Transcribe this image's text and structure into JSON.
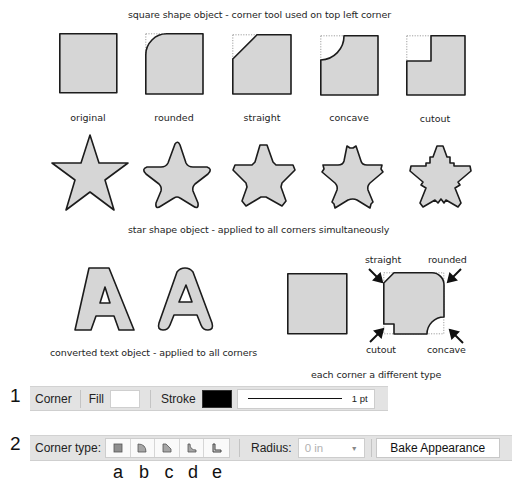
{
  "section_square": {
    "title": "square shape object - corner tool used on top left corner",
    "items": [
      {
        "label": "original",
        "corner": "none"
      },
      {
        "label": "rounded",
        "corner": "rounded"
      },
      {
        "label": "straight",
        "corner": "straight"
      },
      {
        "label": "concave",
        "corner": "concave"
      },
      {
        "label": "cutout",
        "corner": "cutout"
      }
    ]
  },
  "section_star": {
    "title": "star shape object - applied to all corners simultaneously",
    "items": [
      "original",
      "rounded",
      "straight",
      "concave",
      "cutout"
    ]
  },
  "section_text": {
    "caption": "converted text object - applied to all corners",
    "glyph": "A"
  },
  "section_mixed": {
    "caption": "each corner a different type",
    "callouts": {
      "top_left": "straight",
      "top_right": "rounded",
      "bottom_left": "cutout",
      "bottom_right": "concave"
    }
  },
  "toolbar1": {
    "row_number": "1",
    "corner_label": "Corner",
    "fill_label": "Fill",
    "fill_color": "#ffffff",
    "stroke_label": "Stroke",
    "stroke_color": "#000000",
    "stroke_weight": "1 pt"
  },
  "toolbar2": {
    "row_number": "2",
    "corner_type_label": "Corner type:",
    "corner_type_buttons": [
      {
        "letter": "a",
        "icon": "corner-none-icon"
      },
      {
        "letter": "b",
        "icon": "corner-rounded-icon"
      },
      {
        "letter": "c",
        "icon": "corner-straight-icon"
      },
      {
        "letter": "d",
        "icon": "corner-concave-icon"
      },
      {
        "letter": "e",
        "icon": "corner-cutout-icon"
      }
    ],
    "radius_label": "Radius:",
    "radius_value": "0 in",
    "bake_button": "Bake Appearance"
  },
  "colors": {
    "shape_fill": "#d6d6d6",
    "shape_stroke": "#1c1c1c",
    "toolbar_bg": "#e3e3e3"
  }
}
